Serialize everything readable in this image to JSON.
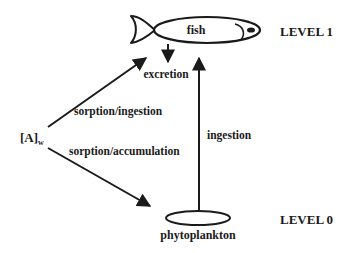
{
  "diagram": {
    "type": "food-chain bioaccumulation diagram",
    "colors": {
      "stroke": "#1a1a1a",
      "background": "#ffffff"
    },
    "levels": [
      {
        "label": "LEVEL 1",
        "organism": "fish"
      },
      {
        "label": "LEVEL 0",
        "organism": "phytoplankton"
      }
    ],
    "nodes": {
      "water": {
        "label": "[A]",
        "subscript": "w"
      },
      "fish": {
        "label": "fish"
      },
      "phytoplankton": {
        "label": "phytoplankton"
      },
      "excretion": {
        "label": "excretion"
      }
    },
    "edges": [
      {
        "from": "[A]w",
        "to": "fish",
        "label": "sorption/ingestion"
      },
      {
        "from": "[A]w",
        "to": "phytoplankton",
        "label": "sorption/accumulation"
      },
      {
        "from": "phytoplankton",
        "to": "fish",
        "label": "ingestion"
      },
      {
        "from": "fish",
        "to": "excretion",
        "label": ""
      }
    ]
  }
}
